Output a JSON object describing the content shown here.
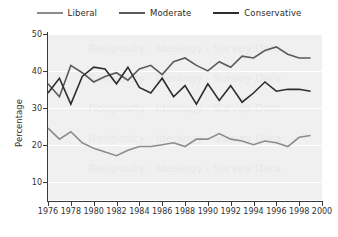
{
  "chart_data": {
    "type": "line",
    "title": "",
    "xlabel": "",
    "ylabel": "Percentage",
    "xlim": [
      1976,
      2000
    ],
    "ylim": [
      5,
      50
    ],
    "yticks": [
      10,
      20,
      30,
      40,
      50
    ],
    "xticks": [
      1976,
      1978,
      1980,
      1982,
      1984,
      1986,
      1988,
      1990,
      1992,
      1994,
      1996,
      1998,
      2000
    ],
    "grid": true,
    "legend_position": "top",
    "x": [
      1976,
      1977,
      1978,
      1979,
      1980,
      1981,
      1982,
      1983,
      1984,
      1985,
      1986,
      1987,
      1988,
      1989,
      1990,
      1991,
      1992,
      1993,
      1994,
      1995,
      1996,
      1997,
      1998,
      1999
    ],
    "series": [
      {
        "name": "Liberal",
        "color": "#8c8c8c",
        "values": [
          24.5,
          21.5,
          23.5,
          20.5,
          19.0,
          18.0,
          17.0,
          18.5,
          19.5,
          19.5,
          20.0,
          20.5,
          19.5,
          21.5,
          21.5,
          23.0,
          21.5,
          21.0,
          20.0,
          21.0,
          20.5,
          19.5,
          22.0,
          22.5
        ]
      },
      {
        "name": "Moderate",
        "color": "#5a5a5a",
        "values": [
          36.5,
          33.0,
          41.5,
          39.5,
          37.0,
          38.5,
          39.5,
          37.5,
          40.5,
          41.5,
          39.0,
          42.5,
          43.5,
          41.5,
          40.0,
          42.5,
          41.0,
          44.0,
          43.5,
          45.5,
          46.5,
          44.5,
          43.5,
          43.5
        ]
      },
      {
        "name": "Conservative",
        "color": "#2e2e2e",
        "values": [
          34.0,
          38.0,
          31.0,
          38.5,
          41.0,
          40.5,
          36.5,
          41.0,
          35.5,
          34.0,
          38.0,
          33.0,
          36.0,
          31.0,
          36.5,
          32.0,
          36.0,
          31.5,
          34.0,
          37.0,
          34.5,
          35.0,
          35.0,
          34.5
        ]
      }
    ],
    "watermark_rows": [
      "Religiosity · Ideology · Survey Data",
      "Religiosity · Ideology · Survey Data",
      "Religiosity · Ideology · Survey Data",
      "Religiosity · Ideology · Survey Data",
      "Religiosity · Ideology · Survey Data"
    ]
  },
  "legend": {
    "items": [
      {
        "label": "Liberal",
        "color": "#8c8c8c"
      },
      {
        "label": "Moderate",
        "color": "#5a5a5a"
      },
      {
        "label": "Conservative",
        "color": "#2e2e2e"
      }
    ]
  },
  "axes": {
    "y_title": "Percentage",
    "y_ticks": [
      "50",
      "40",
      "30",
      "20",
      "10"
    ],
    "x_ticks": [
      "1976",
      "1978",
      "1980",
      "1982",
      "1984",
      "1986",
      "1988",
      "1990",
      "1992",
      "1994",
      "1996",
      "1998",
      "2000"
    ]
  }
}
